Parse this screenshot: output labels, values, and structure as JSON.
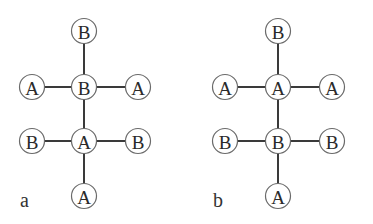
{
  "diagrams": [
    {
      "label": "a",
      "label_pos": [
        20,
        207
      ],
      "nodes": [
        {
          "id": "a1",
          "text": "B",
          "x": 84,
          "y": 31
        },
        {
          "id": "a2",
          "text": "A",
          "x": 32,
          "y": 87
        },
        {
          "id": "a3",
          "text": "B",
          "x": 84,
          "y": 87
        },
        {
          "id": "a4",
          "text": "A",
          "x": 138,
          "y": 87
        },
        {
          "id": "a5",
          "text": "B",
          "x": 32,
          "y": 141
        },
        {
          "id": "a6",
          "text": "A",
          "x": 84,
          "y": 141
        },
        {
          "id": "a7",
          "text": "B",
          "x": 138,
          "y": 141
        },
        {
          "id": "a8",
          "text": "A",
          "x": 84,
          "y": 196
        }
      ],
      "edges": [
        [
          "a1",
          "a3"
        ],
        [
          "a2",
          "a3"
        ],
        [
          "a3",
          "a4"
        ],
        [
          "a3",
          "a6"
        ],
        [
          "a5",
          "a6"
        ],
        [
          "a6",
          "a7"
        ],
        [
          "a6",
          "a8"
        ]
      ]
    },
    {
      "label": "b",
      "label_pos": [
        213,
        207
      ],
      "nodes": [
        {
          "id": "b1",
          "text": "B",
          "x": 278,
          "y": 31
        },
        {
          "id": "b2",
          "text": "A",
          "x": 225,
          "y": 87
        },
        {
          "id": "b3",
          "text": "A",
          "x": 278,
          "y": 87
        },
        {
          "id": "b4",
          "text": "A",
          "x": 332,
          "y": 87
        },
        {
          "id": "b5",
          "text": "B",
          "x": 225,
          "y": 141
        },
        {
          "id": "b6",
          "text": "B",
          "x": 278,
          "y": 141
        },
        {
          "id": "b7",
          "text": "B",
          "x": 332,
          "y": 141
        },
        {
          "id": "b8",
          "text": "A",
          "x": 278,
          "y": 196
        }
      ],
      "edges": [
        [
          "b1",
          "b3"
        ],
        [
          "b2",
          "b3"
        ],
        [
          "b3",
          "b4"
        ],
        [
          "b3",
          "b6"
        ],
        [
          "b5",
          "b6"
        ],
        [
          "b6",
          "b7"
        ],
        [
          "b6",
          "b8"
        ]
      ]
    }
  ],
  "node_radius": 12.5
}
